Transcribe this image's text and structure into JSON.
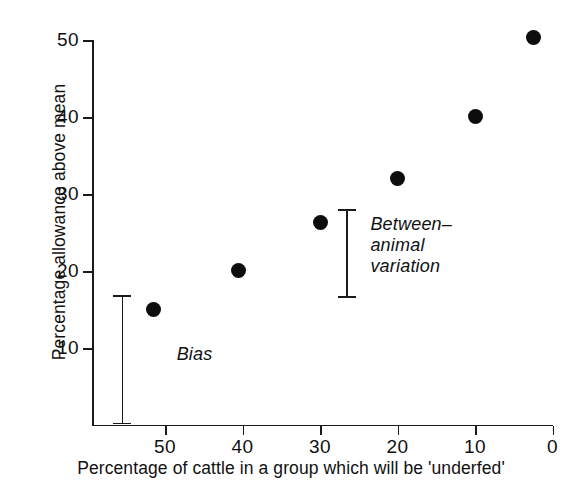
{
  "chart_data": {
    "type": "scatter",
    "title": "",
    "xlabel": "Percentage of cattle in a group which will be 'underfed'",
    "ylabel": "Percentage allowance above mean",
    "xlim": [
      59.3,
      0
    ],
    "ylim": [
      0,
      50
    ],
    "x_reversed": true,
    "grid": false,
    "legend": "none",
    "xticks": [
      50,
      40,
      30,
      20,
      10,
      0
    ],
    "xtick_labels": [
      "50",
      "40",
      "30",
      "20",
      "10",
      "0"
    ],
    "yticks": [
      10,
      20,
      30,
      40,
      50
    ],
    "ytick_labels": [
      "10",
      "20",
      "30",
      "40",
      "50"
    ],
    "points": [
      {
        "x": 51.5,
        "y": 15.0
      },
      {
        "x": 40.5,
        "y": 20.0
      },
      {
        "x": 30.0,
        "y": 26.3
      },
      {
        "x": 20.0,
        "y": 32.0
      },
      {
        "x": 10.0,
        "y": 40.0
      },
      {
        "x": 2.5,
        "y": 50.3
      }
    ],
    "annotations": [
      {
        "id": "bias",
        "label": "Bias",
        "x": 55.5,
        "y_low": 0.0,
        "y_high": 16.8,
        "label_x": 48.5,
        "label_y": 9.0
      },
      {
        "id": "between-animal-variation",
        "label": "Between–\nanimal\nvariation",
        "x": 26.5,
        "y_low": 16.5,
        "y_high": 28.0,
        "label_x": 23.5,
        "label_y": 26.0
      }
    ]
  },
  "axes": {
    "y_title": "Percentage allowance above mean",
    "x_title": "Percentage of cattle in a group which will be 'underfed'",
    "y_tick_labels": [
      "50",
      "40",
      "30",
      "20",
      "10"
    ],
    "x_tick_labels": [
      "50",
      "40",
      "30",
      "20",
      "10",
      "0"
    ]
  },
  "annotations": {
    "bias": "Bias",
    "between_animal_variation": "Between–\nanimal\nvariation"
  },
  "colors": {
    "marker": "#0d0d0d",
    "axis": "#1a1a1a",
    "text": "#111111",
    "background": "#ffffff"
  }
}
